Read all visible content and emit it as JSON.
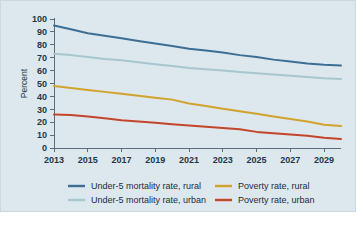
{
  "chart_data": {
    "type": "line",
    "title": "",
    "xlabel": "",
    "ylabel": "Percent",
    "xlim": [
      2013,
      2030
    ],
    "ylim": [
      0,
      100
    ],
    "grid": false,
    "legend_position": "bottom",
    "x": [
      2013,
      2014,
      2015,
      2016,
      2017,
      2018,
      2019,
      2020,
      2021,
      2022,
      2023,
      2024,
      2025,
      2026,
      2027,
      2028,
      2029,
      2030
    ],
    "x_tick_labels": [
      "2013",
      "2015",
      "2017",
      "2019",
      "2021",
      "2023",
      "2025",
      "2027",
      "2029"
    ],
    "x_ticks": [
      2013,
      2015,
      2017,
      2019,
      2021,
      2023,
      2025,
      2027,
      2029
    ],
    "y_ticks": [
      0,
      10,
      20,
      30,
      40,
      50,
      60,
      70,
      80,
      90,
      100
    ],
    "y_tick_labels": [
      "0",
      "10",
      "20",
      "30",
      "40",
      "50",
      "60",
      "70",
      "80",
      "90",
      "100"
    ],
    "series": [
      {
        "name": "Under-5 mortality rate, rural",
        "color": "#3c6e94",
        "values": [
          95,
          92,
          89,
          87,
          85,
          83,
          81,
          79,
          77,
          75.5,
          74,
          72,
          70.5,
          68.5,
          67,
          65.5,
          64.5,
          64
        ]
      },
      {
        "name": "Under-5 mortality rate, urban",
        "color": "#a8c6ce",
        "values": [
          73,
          72,
          70.5,
          69,
          68,
          66.5,
          65,
          63.5,
          62,
          61,
          60,
          59,
          58,
          57,
          56,
          55,
          54,
          53.5
        ]
      },
      {
        "name": "Poverty rate, rural",
        "color": "#d1a32c",
        "values": [
          48,
          46.5,
          45,
          43.5,
          42,
          40.5,
          39,
          37.5,
          34.5,
          32.5,
          30.5,
          28.5,
          26.5,
          24.5,
          22.5,
          20.5,
          18,
          17
        ]
      },
      {
        "name": "Poverty rate, urban",
        "color": "#c4462a",
        "values": [
          26,
          25.5,
          24.5,
          23,
          21.5,
          20.5,
          19.5,
          18.5,
          17.5,
          16.5,
          15.5,
          14.5,
          12.5,
          11.5,
          10.5,
          9.5,
          8,
          7
        ]
      }
    ],
    "legend": [
      {
        "label": "Under-5 mortality rate, rural",
        "color": "#3c6e94"
      },
      {
        "label": "Poverty rate, rural",
        "color": "#d1a32c"
      },
      {
        "label": "Under-5 mortality rate, urban",
        "color": "#a8c6ce"
      },
      {
        "label": "Poverty rate, urban",
        "color": "#c4462a"
      }
    ]
  },
  "style": {
    "panel_background": "#dde7ee",
    "page_background": "#ffffff",
    "axis_color": "#5a6b7a",
    "text_color": "#243746"
  }
}
